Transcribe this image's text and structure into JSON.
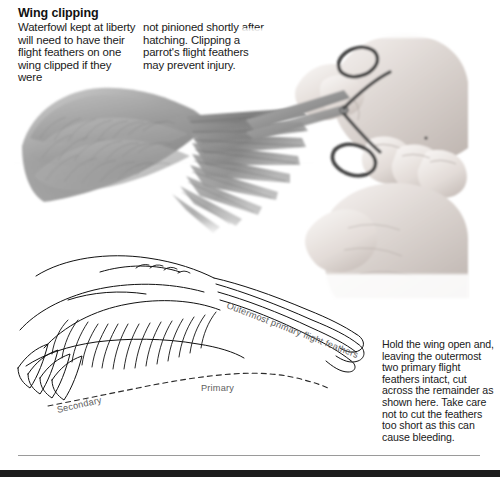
{
  "page": {
    "heading": "Wing clipping",
    "columns": {
      "left": "Waterfowl kept at liberty will need to have their flight feathers on one wing clipped if they were",
      "right": "not pinioned shortly after hatching. Clipping a parrot's flight feathers may prevent injury."
    },
    "side_note": "Hold the wing open and, leaving the outermost two primary flight feathers intact, cut across the remainder as shown here. Take care not to cut the feathers too short as this can cause bleeding."
  },
  "diagram": {
    "labels": {
      "outermost": "Outermost primary flight feathers",
      "secondary": "Secondary",
      "primary": "Primary"
    },
    "illustrations": {
      "photo_wing": "spread-bird-wing-photo",
      "photo_hands": "hands-holding-scissors-photo",
      "line_drawing": "wing-feather-line-diagram"
    }
  },
  "colors": {
    "background": "#ffffff",
    "text": "#1a1a1a",
    "label": "#5e5e5e",
    "rule": "#9a9a9a",
    "bar": "#1c1c1c"
  }
}
